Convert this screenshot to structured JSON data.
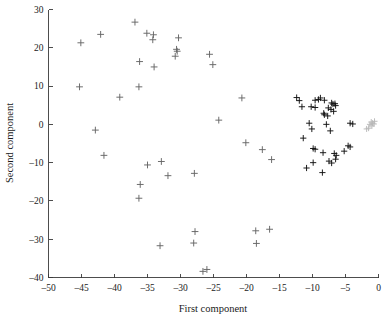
{
  "chart_data": {
    "type": "scatter",
    "title": "",
    "xlabel": "First component",
    "ylabel": "Second component",
    "xlim": [
      -50,
      0
    ],
    "ylim": [
      -40,
      30
    ],
    "xticks": [
      -50,
      -45,
      -40,
      -35,
      -30,
      -25,
      -20,
      -15,
      -10,
      -5,
      0
    ],
    "xtick_labels": [
      "–50",
      "–45",
      "–40",
      "–35",
      "–30",
      "–25",
      "–20",
      "–15",
      "–10",
      "–5",
      "0"
    ],
    "yticks": [
      -40,
      -30,
      -20,
      -10,
      0,
      10,
      20,
      30
    ],
    "ytick_labels": [
      "–40",
      "–30",
      "–20",
      "–10",
      "0",
      "10",
      "20",
      "30"
    ],
    "grid": false,
    "legend": "none",
    "marker": "plus",
    "series": [
      {
        "name": "sparse-group",
        "color": "#666666",
        "marker_size": 3.4,
        "points": [
          [
            -45.1,
            21.3
          ],
          [
            -42.1,
            23.5
          ],
          [
            -36.9,
            26.7
          ],
          [
            -35.1,
            23.8
          ],
          [
            -34.1,
            23.4
          ],
          [
            -34.2,
            22.1
          ],
          [
            -30.3,
            22.6
          ],
          [
            -36.2,
            16.4
          ],
          [
            -30.5,
            19.1
          ],
          [
            -30.6,
            19.6
          ],
          [
            -30.8,
            17.8
          ],
          [
            -34.0,
            15.0
          ],
          [
            -25.6,
            18.3
          ],
          [
            -25.1,
            15.6
          ],
          [
            -45.3,
            9.8
          ],
          [
            -36.3,
            9.8
          ],
          [
            -39.2,
            7.1
          ],
          [
            -20.7,
            6.9
          ],
          [
            -24.2,
            1.1
          ],
          [
            -42.9,
            -1.5
          ],
          [
            -41.6,
            -8.1
          ],
          [
            -20.1,
            -4.8
          ],
          [
            -32.9,
            -9.7
          ],
          [
            -35.0,
            -10.6
          ],
          [
            -17.6,
            -6.6
          ],
          [
            -16.2,
            -9.2
          ],
          [
            -31.9,
            -13.4
          ],
          [
            -27.9,
            -12.8
          ],
          [
            -36.1,
            -15.7
          ],
          [
            -36.3,
            -19.3
          ],
          [
            -27.8,
            -28.0
          ],
          [
            -18.6,
            -27.8
          ],
          [
            -16.5,
            -27.4
          ],
          [
            -33.1,
            -31.7
          ],
          [
            -28.0,
            -31.0
          ],
          [
            -18.5,
            -31.1
          ],
          [
            -26.6,
            -38.4
          ],
          [
            -26.0,
            -37.9
          ]
        ]
      },
      {
        "name": "dense-cluster",
        "color": "#111111",
        "marker_size": 3.1,
        "points": [
          [
            -12.4,
            7.0
          ],
          [
            -12.0,
            6.2
          ],
          [
            -9.6,
            6.3
          ],
          [
            -9.1,
            6.5
          ],
          [
            -8.8,
            6.9
          ],
          [
            -8.2,
            6.3
          ],
          [
            -7.1,
            5.6
          ],
          [
            -6.9,
            5.3
          ],
          [
            -6.6,
            5.4
          ],
          [
            -6.5,
            4.9
          ],
          [
            -11.6,
            4.6
          ],
          [
            -10.2,
            4.6
          ],
          [
            -9.6,
            4.4
          ],
          [
            -7.6,
            4.3
          ],
          [
            -7.2,
            3.9
          ],
          [
            -6.8,
            3.4
          ],
          [
            -8.3,
            2.9
          ],
          [
            -8.2,
            2.5
          ],
          [
            -7.7,
            2.2
          ],
          [
            -10.5,
            0.3
          ],
          [
            -7.9,
            0.0
          ],
          [
            -4.3,
            0.3
          ],
          [
            -3.9,
            0.1
          ],
          [
            -10.1,
            -1.2
          ],
          [
            -7.3,
            -1.7
          ],
          [
            -11.4,
            -3.6
          ],
          [
            -4.6,
            -5.6
          ],
          [
            -4.3,
            -5.9
          ],
          [
            -9.9,
            -6.3
          ],
          [
            -9.6,
            -6.5
          ],
          [
            -8.4,
            -7.4
          ],
          [
            -6.7,
            -7.6
          ],
          [
            -6.4,
            -8.1
          ],
          [
            -6.5,
            -9.1
          ],
          [
            -10.9,
            -11.4
          ],
          [
            -9.9,
            -10.0
          ],
          [
            -7.5,
            -9.6
          ],
          [
            -7.1,
            -10.1
          ],
          [
            -8.5,
            -12.6
          ],
          [
            -5.2,
            -7.0
          ]
        ]
      },
      {
        "name": "edge-cluster",
        "color": "#b8b8b8",
        "marker_size": 3.0,
        "points": [
          [
            -1.1,
            0.6
          ],
          [
            -0.9,
            0.3
          ],
          [
            -0.7,
            0.1
          ],
          [
            -1.3,
            0.0
          ],
          [
            -1.0,
            -0.4
          ],
          [
            -1.5,
            -1.0
          ],
          [
            -0.6,
            0.8
          ],
          [
            -1.8,
            -1.2
          ]
        ]
      }
    ]
  },
  "axes": {
    "x_title": "First component",
    "y_title": "Second component"
  }
}
